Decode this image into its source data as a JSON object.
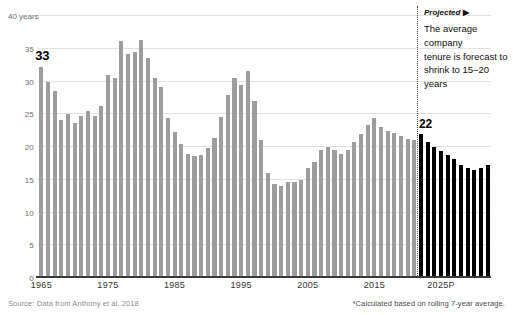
{
  "chart_data": {
    "type": "bar",
    "title": "",
    "subtitle": "",
    "xlabel": "",
    "ylabel": "40 years",
    "ylim": [
      0,
      40
    ],
    "grid": true,
    "legend_position": "none",
    "y_ticks": [
      0,
      5,
      10,
      15,
      20,
      25,
      30,
      35,
      40
    ],
    "y_tick_labels": [
      "0",
      "5",
      "10",
      "15",
      "20",
      "25",
      "30",
      "35",
      "40 years"
    ],
    "x_ticks": [
      1965,
      1975,
      1985,
      1995,
      2005,
      2015,
      2025
    ],
    "x_tick_labels": [
      "1965",
      "1975",
      "1985",
      "1995",
      "2005",
      "2015",
      "2025P"
    ],
    "series": [
      {
        "name": "Historical",
        "color": "#9d9d9d",
        "x": [
          1965,
          1966,
          1967,
          1968,
          1969,
          1970,
          1971,
          1972,
          1973,
          1974,
          1975,
          1976,
          1977,
          1978,
          1979,
          1980,
          1981,
          1982,
          1983,
          1984,
          1985,
          1986,
          1987,
          1988,
          1989,
          1990,
          1991,
          1992,
          1993,
          1994,
          1995,
          1996,
          1997,
          1998,
          1999,
          2000,
          2001,
          2002,
          2003,
          2004,
          2005,
          2006,
          2007,
          2008,
          2009,
          2010,
          2011,
          2012,
          2013,
          2014,
          2015,
          2016,
          2017,
          2018,
          2019,
          2020,
          2021
        ],
        "values": [
          32.2,
          29.9,
          28.6,
          24.1,
          25.0,
          23.7,
          24.7,
          25.5,
          24.8,
          26.3,
          31.0,
          30.5,
          36.2,
          34.2,
          34.5,
          36.3,
          33.6,
          30.5,
          29.2,
          24.5,
          22.3,
          20.5,
          19.0,
          18.7,
          18.8,
          19.8,
          21.4,
          24.6,
          28.0,
          30.5,
          29.5,
          31.6,
          27.0,
          21.0,
          16.0,
          14.4,
          14.0,
          14.7,
          14.6,
          15.0,
          16.8,
          17.7,
          19.5,
          20.0,
          19.5,
          19.0,
          19.5,
          20.7,
          22.0,
          23.3,
          24.5,
          23.0,
          22.5,
          22.2,
          21.7,
          21.3,
          21.0
        ]
      },
      {
        "name": "Projected",
        "color": "#000000",
        "x": [
          2022,
          2023,
          2024,
          2025,
          2026,
          2027,
          2028,
          2029,
          2030,
          2031,
          2032
        ],
        "values": [
          22.0,
          20.8,
          20.0,
          19.4,
          18.8,
          18.2,
          17.3,
          16.8,
          16.5,
          16.8,
          17.3
        ]
      }
    ],
    "annotations": [
      {
        "name": "first-value-label",
        "text": "33",
        "x": 1965,
        "y": 33
      },
      {
        "name": "projection-start-label",
        "text": "22",
        "x": 2022,
        "y": 22
      }
    ],
    "divider": {
      "name": "projection-divider",
      "x": 2021.5,
      "style": "dotted"
    }
  },
  "axis": {
    "y_top_label": "40 years",
    "y_labels": [
      "35",
      "30",
      "25",
      "20",
      "15",
      "10",
      "5",
      "0"
    ],
    "x_labels": [
      "1965",
      "1975",
      "1985",
      "1995",
      "2005",
      "2015",
      "2025P"
    ]
  },
  "annotations": {
    "value_33": "33",
    "value_22": "22"
  },
  "projected": {
    "header": "Projected",
    "arrow": "▶",
    "line1": "The average company",
    "line2": "tenure is forecast to",
    "line3": "shrink to 15–20 years"
  },
  "footer": {
    "source": "Source: Data from Anthony et al. 2018",
    "footnote": "*Calculated based on rolling 7-year average."
  },
  "colors": {
    "historical_bar": "#9d9d9d",
    "projected_bar": "#000000",
    "gridline": "#e2e2e2",
    "axis": "#3a3a3a"
  }
}
